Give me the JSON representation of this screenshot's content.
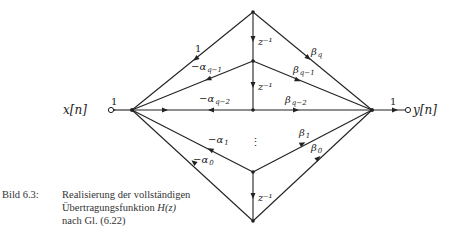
{
  "diagram": {
    "type": "signal-flow-graph",
    "input": {
      "label": "x[n]",
      "gain": "1"
    },
    "output": {
      "label": "y[n]",
      "gain": "1"
    },
    "delays": [
      "z⁻¹",
      "z⁻¹",
      "z⁻¹"
    ],
    "feedback_branches": [
      {
        "label": "1",
        "sub": ""
      },
      {
        "label": "−α",
        "sub": "q−1"
      },
      {
        "label": "−α",
        "sub": "q−2"
      },
      {
        "label": "−α",
        "sub": "1"
      },
      {
        "label": "−α",
        "sub": "0"
      }
    ],
    "feedforward_branches": [
      {
        "label": "β",
        "sub": "q"
      },
      {
        "label": "β",
        "sub": "q−1"
      },
      {
        "label": "β",
        "sub": "q−2"
      },
      {
        "label": "β",
        "sub": "1"
      },
      {
        "label": "β",
        "sub": "0"
      }
    ],
    "ellipsis": "⋮"
  },
  "caption": {
    "number": "Bild 6.3:",
    "line1": "Realisierung der vollständigen",
    "line2_pre": "Übertragungsfunktion ",
    "line2_math": "H(z)",
    "line3": "nach Gl. (6.22)"
  }
}
